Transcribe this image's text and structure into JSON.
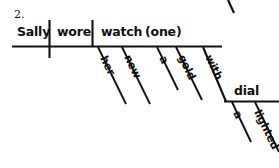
{
  "exercise": {
    "number": "2."
  },
  "diagram": {
    "type": "reed-kellogg-sentence-diagram",
    "sentence": "Sally wore her new a gold watch (one) with a lighted dial",
    "ink_color": "#111111",
    "baseline": {
      "subject": "Sally",
      "verb": "wore",
      "direct_object": "watch",
      "appositive": "(one)"
    },
    "modifiers_on_object": [
      {
        "word": "her"
      },
      {
        "word": "new"
      },
      {
        "word": "a"
      },
      {
        "word": "gold"
      }
    ],
    "prepositional_phrase": {
      "preposition": "with",
      "object": "dial",
      "object_modifiers": [
        {
          "word": "a"
        },
        {
          "word": "lighted"
        }
      ]
    }
  }
}
